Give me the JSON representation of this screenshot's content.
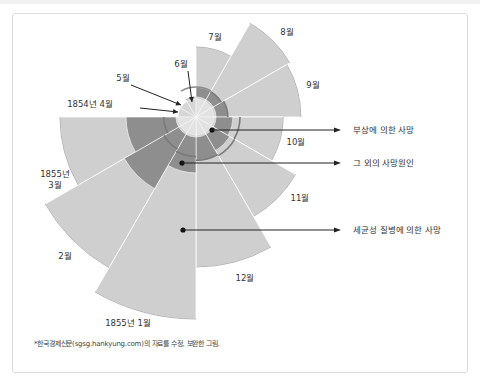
{
  "chart_data": {
    "type": "polar-area",
    "title": "",
    "center_note": "Nightingale rose diagram, wedge radius ∝ √value, clockwise from 7월 at 12 o'clock",
    "categories": [
      "1854년 4월",
      "5월",
      "6월",
      "7월",
      "8월",
      "9월",
      "10월",
      "11월",
      "12월",
      "1855년 1월",
      "2월",
      "1855년\n3월"
    ],
    "series": [
      {
        "name": "세균성 질병에 의한 사망",
        "key": "disease",
        "color": "#cfcfcf",
        "values": [
          1.4,
          2.6,
          4.0,
          49,
          117,
          110,
          76,
          132,
          225,
          408,
          303,
          185
        ]
      },
      {
        "name": "그 외의 사망원인",
        "key": "other",
        "color": "#8e8e8e",
        "values": [
          1.4,
          1.2,
          0.9,
          1.4,
          1.4,
          2.0,
          3.6,
          4.4,
          6.8,
          14.4,
          42,
          27
        ]
      },
      {
        "name": "부상에 의한 사망",
        "key": "wounds",
        "color": "#b9b9b9",
        "values": [
          0,
          0,
          0,
          0,
          0.5,
          1.7,
          16,
          17,
          15,
          9,
          6,
          2
        ]
      }
    ],
    "annotations": [
      {
        "text": "부상에 의한 사망",
        "points_to": "wounds"
      },
      {
        "text": "그 외의 사망원인",
        "points_to": "other"
      },
      {
        "text": "세균성 질병에 의한 사망",
        "points_to": "disease"
      }
    ],
    "legend": "right"
  },
  "footnote": "*한국경제신문(sgsg.hankyung.com)의 자료를 수정, 보완한 그림."
}
